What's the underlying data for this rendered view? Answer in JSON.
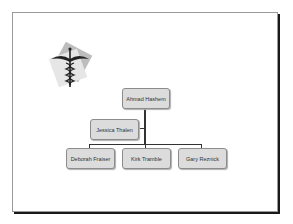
{
  "slide": {
    "logo": {
      "icon": "caduceus-icon",
      "description": "medical caduceus logo on rotated gray squares"
    },
    "org_chart": {
      "root": {
        "name": "Ahmad Hashem"
      },
      "assistant": {
        "name": "Jessica Thalen"
      },
      "subordinates": [
        {
          "name": "Deborah Fraiser"
        },
        {
          "name": "Kirk Tramble"
        },
        {
          "name": "Gary Reznick"
        }
      ]
    }
  },
  "colors": {
    "node_fill": "#dcdcdc",
    "node_border": "#8c8c8c",
    "connector": "#333333"
  }
}
